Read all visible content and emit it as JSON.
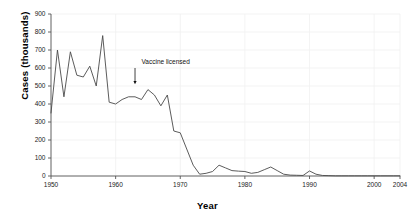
{
  "chart_data": {
    "type": "line",
    "title": "",
    "xlabel": "Year",
    "ylabel": "Cases (thousands)",
    "xlim": [
      1950,
      2004
    ],
    "ylim": [
      0,
      900
    ],
    "grid": true,
    "legend": "none",
    "line_color": "#4a4a4a",
    "xticks": [
      1950,
      1960,
      1970,
      1980,
      1990,
      2000,
      2004
    ],
    "xtick_labels": [
      "1950",
      "1960",
      "1970",
      "1980",
      "1990",
      "2000",
      "2004"
    ],
    "yticks": [
      0,
      100,
      200,
      300,
      400,
      500,
      600,
      700,
      800,
      900
    ],
    "ytick_labels": [
      "0",
      "100",
      "200",
      "300",
      "400",
      "500",
      "600",
      "700",
      "800",
      "900"
    ],
    "series": [
      {
        "name": "Measles cases",
        "x": [
          1950,
          1951,
          1952,
          1953,
          1954,
          1955,
          1956,
          1957,
          1958,
          1959,
          1960,
          1961,
          1962,
          1963,
          1964,
          1965,
          1966,
          1967,
          1968,
          1969,
          1970,
          1971,
          1972,
          1973,
          1974,
          1975,
          1976,
          1977,
          1978,
          1979,
          1980,
          1981,
          1982,
          1983,
          1984,
          1985,
          1986,
          1987,
          1988,
          1989,
          1990,
          1991,
          1992,
          1993,
          1994,
          1995,
          1996,
          1997,
          1998,
          1999,
          2000,
          2001,
          2002,
          2003,
          2004
        ],
        "values": [
          350,
          700,
          440,
          690,
          560,
          550,
          610,
          500,
          780,
          410,
          400,
          425,
          440,
          440,
          425,
          480,
          450,
          390,
          450,
          250,
          240,
          150,
          60,
          10,
          15,
          25,
          60,
          45,
          30,
          27,
          25,
          15,
          20,
          35,
          50,
          30,
          10,
          5,
          4,
          3,
          28,
          10,
          3,
          2,
          1,
          1,
          1,
          1,
          1,
          1,
          1,
          1,
          1,
          1,
          1
        ]
      }
    ],
    "annotations": [
      {
        "text": "Vaccine licensed",
        "year": 1963,
        "label_year": 1964,
        "label_value": 620,
        "arrow_from_value": 600,
        "arrow_to_value": 510
      }
    ]
  }
}
